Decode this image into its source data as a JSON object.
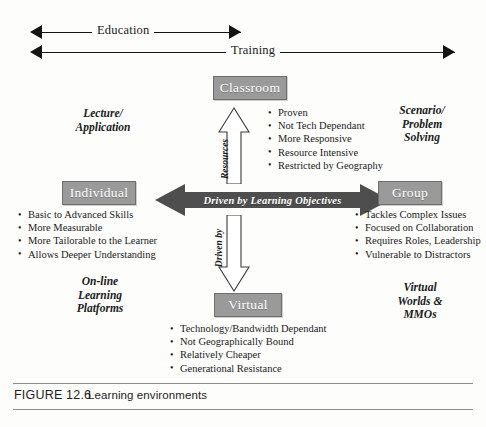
{
  "figure": {
    "number": "FIGURE 12.6",
    "title": "Learning environments"
  },
  "scales": [
    {
      "label": "Education",
      "direction": "double"
    },
    {
      "label": "Training",
      "direction": "double"
    }
  ],
  "axes": {
    "horizontal_label": "Driven by Learning Objectives",
    "vertical_label_part1": "Driven by",
    "vertical_label_part2": "Resources"
  },
  "nodes": {
    "top": {
      "label": "Classroom"
    },
    "left": {
      "label": "Individual"
    },
    "right": {
      "label": "Group"
    },
    "bottom": {
      "label": "Virtual"
    }
  },
  "corners": {
    "top_left": "Lecture/\nApplication",
    "top_left_l1": "Lecture/",
    "top_left_l2": "Application",
    "top_right_l1": "Scenario/",
    "top_right_l2": "Problem",
    "top_right_l3": "Solving",
    "bottom_left_l1": "On-line",
    "bottom_left_l2": "Learning",
    "bottom_left_l3": "Platforms",
    "bottom_right_l1": "Virtual",
    "bottom_right_l2": "Worlds &",
    "bottom_right_l3": "MMOs"
  },
  "bullets": {
    "classroom": [
      "Proven",
      "Not Tech Dependant",
      "More Responsive",
      "Resource Intensive",
      "Restricted by Geography"
    ],
    "individual": [
      "Basic to Advanced Skills",
      "More Measurable",
      "More Tailorable to the Learner",
      "Allows Deeper Understanding"
    ],
    "group": [
      "Tackles Complex Issues",
      "Focused on Collaboration",
      "Requires Roles, Leadership",
      "Vulnerable to Distractors"
    ],
    "virtual": [
      "Technology/Bandwidth Dependant",
      "Not Geographically Bound",
      "Relatively Cheaper",
      "Generational Resistance"
    ]
  },
  "colors": {
    "node_fill": "#9a9a9a",
    "node_border": "#6e6e6e",
    "node_text": "#ffffff",
    "arrow_dark": "#4e4e4e",
    "line": "#141414",
    "caption_rule": "#8d8d8d",
    "background": "#fdfdfc"
  }
}
